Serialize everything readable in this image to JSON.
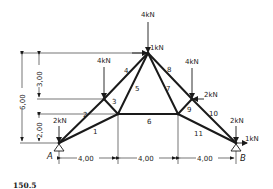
{
  "figure": {
    "caption": "150.5",
    "type": "plane truss"
  },
  "supports": {
    "left": {
      "label": "A"
    },
    "right": {
      "label": "B"
    }
  },
  "members": [
    {
      "id": "1",
      "label": "1"
    },
    {
      "id": "2",
      "label": "2"
    },
    {
      "id": "3",
      "label": "3"
    },
    {
      "id": "4",
      "label": "4"
    },
    {
      "id": "5",
      "label": "5"
    },
    {
      "id": "6",
      "label": "6"
    },
    {
      "id": "7",
      "label": "7"
    },
    {
      "id": "8",
      "label": "8"
    },
    {
      "id": "9",
      "label": "9"
    },
    {
      "id": "10",
      "label": "10"
    },
    {
      "id": "11",
      "label": "11"
    }
  ],
  "loads": {
    "apex_vertical": "4kN",
    "apex_horizontal": "1kN",
    "left_upper_vertical": "4kN",
    "right_upper_vertical": "4kN",
    "right_upper_horizontal": "2kN",
    "support_A_vertical": "2kN",
    "support_B_vertical": "2kN",
    "support_B_horizontal": "1kN"
  },
  "dimensions": {
    "horizontal": [
      "4,00",
      "4,00",
      "4,00"
    ],
    "total_height": "6,00",
    "upper_height": "3,00",
    "lower_height": "2,00"
  }
}
